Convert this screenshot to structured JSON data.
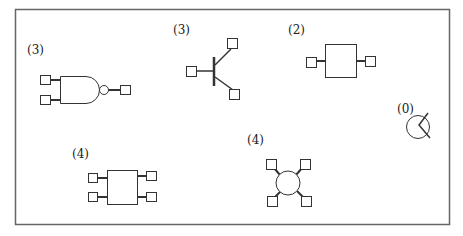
{
  "frame": {
    "x": 15,
    "y": 9,
    "width": 434,
    "height": 215,
    "stroke": "#555555"
  },
  "symbols": [
    {
      "id": "nand-gate",
      "label": "(3)",
      "terminals": 3
    },
    {
      "id": "transistor",
      "label": "(3)",
      "terminals": 3
    },
    {
      "id": "two-terminal-block",
      "label": "(2)",
      "terminals": 2
    },
    {
      "id": "terminal-less-circle",
      "label": "(0)",
      "terminals": 0
    },
    {
      "id": "four-terminal-block",
      "label": "(4)",
      "terminals": 4
    },
    {
      "id": "four-terminal-circle",
      "label": "(4)",
      "terminals": 4
    }
  ],
  "colors": {
    "stroke": "#333333",
    "fill": "#ffffff"
  }
}
